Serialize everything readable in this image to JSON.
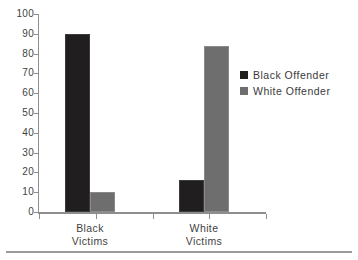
{
  "chart_data": {
    "type": "bar",
    "title": "",
    "subtitle": "",
    "xlabel": "",
    "ylabel": "",
    "categories": [
      "Black Victims",
      "White Victims"
    ],
    "series": [
      {
        "name": "Black Offender",
        "color": "#201e1e",
        "values": [
          90,
          16
        ]
      },
      {
        "name": "White Offender",
        "color": "#6e6e6e",
        "values": [
          10,
          84
        ]
      }
    ],
    "ylim": [
      0,
      100
    ],
    "ytick_step": 10,
    "yticks": [
      100,
      90,
      80,
      70,
      60,
      50,
      40,
      30,
      20,
      10,
      0
    ],
    "ytick_labels": [
      "100",
      "90",
      "80",
      "70",
      "60",
      "50",
      "40",
      "30",
      "20",
      "10",
      "0"
    ],
    "grid": false,
    "legend_position": "right",
    "legend": [
      {
        "label": "Black Offender",
        "color": "#201e1e"
      },
      {
        "label": "White Offender",
        "color": "#6e6e6e"
      }
    ],
    "axis_color": "#8e8e8e",
    "background": "#ffffff"
  }
}
